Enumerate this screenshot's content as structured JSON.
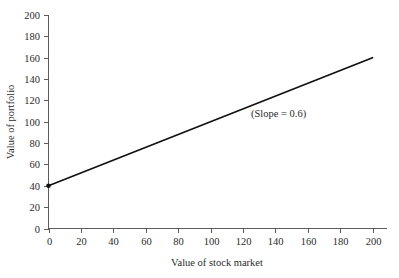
{
  "chart_data": {
    "type": "line",
    "title": "",
    "xlabel": "Value of stock market",
    "ylabel": "Value of portfolio",
    "xlim": [
      0,
      200
    ],
    "ylim": [
      0,
      200
    ],
    "xticks": [
      0,
      20,
      40,
      60,
      80,
      100,
      120,
      140,
      160,
      180,
      200
    ],
    "xtick_labels": [
      "0",
      "20",
      "40",
      "60",
      "80",
      "100",
      "120",
      "140",
      "160",
      "180",
      "200"
    ],
    "yticks": [
      0,
      20,
      40,
      60,
      80,
      100,
      120,
      140,
      160,
      180,
      200
    ],
    "ytick_labels": [
      "0",
      "20",
      "40",
      "60",
      "80",
      "100",
      "120",
      "140",
      "160",
      "180",
      "200"
    ],
    "grid": false,
    "legend": null,
    "series": [
      {
        "name": "portfolio value",
        "x": [
          0,
          200
        ],
        "values": [
          40,
          160
        ],
        "slope": 0.6,
        "intercept": 40,
        "color": "#111111",
        "marker_points": [
          {
            "x": 0,
            "y": 40
          }
        ]
      }
    ],
    "annotations": [
      {
        "text": "(Slope = 0.6)",
        "x": 142,
        "y": 104
      }
    ],
    "colors": {
      "line": "#111111",
      "axis": "#4a4a4a",
      "text": "#2b2b2b",
      "background": "#ffffff"
    }
  }
}
